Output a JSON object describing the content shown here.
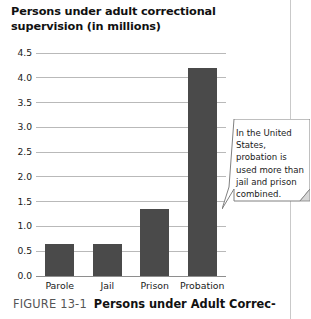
{
  "chart_data": {
    "type": "bar",
    "title": "Persons under adult correctional supervision (in millions)",
    "xlabel": "",
    "ylabel": "",
    "categories": [
      "Parole",
      "Jail",
      "Prison",
      "Probation"
    ],
    "values": [
      0.65,
      0.65,
      1.35,
      4.2
    ],
    "ylim": [
      0.0,
      4.5
    ],
    "yticks": [
      "0.0",
      "0.5",
      "1.0",
      "1.5",
      "2.0",
      "2.5",
      "3.0",
      "3.5",
      "4.0",
      "4.5"
    ],
    "grid": true,
    "legend": "none",
    "bar_color": "#4a4a4a",
    "grid_color": "#b9b9b9"
  },
  "annotation": {
    "text": "In the United States, probation is used more than jail and prison combined."
  },
  "caption": {
    "label": "FIGURE 13-1",
    "title": "Persons under Adult Correc-"
  }
}
